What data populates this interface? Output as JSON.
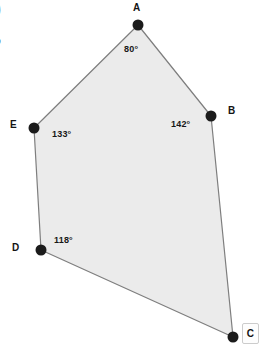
{
  "figure": {
    "type": "polygon-angle-diagram",
    "shape_name": "pentagon ABCDE",
    "canvas": {
      "width": 264,
      "height": 349
    },
    "style": {
      "background": "#ffffff",
      "fill": "#ebebeb",
      "stroke": "#7e7e7e",
      "stroke_width": 1.2,
      "vertex_dot_color": "#1b1b1b",
      "vertex_dot_radius": 5,
      "label_color": "#141414"
    },
    "vertices": [
      {
        "id": "A",
        "label": "A",
        "x": 138,
        "y": 25,
        "label_x": 133,
        "label_y": 3,
        "angle": "80°",
        "angle_x": 124,
        "angle_y": 45
      },
      {
        "id": "B",
        "label": "B",
        "x": 211,
        "y": 116,
        "label_x": 228,
        "label_y": 106,
        "angle": "142°",
        "angle_x": 171,
        "angle_y": 120
      },
      {
        "id": "C",
        "label": "C",
        "x": 233,
        "y": 337,
        "label_x": 242,
        "label_y": 323,
        "angle": "",
        "angle_x": 0,
        "angle_y": 0
      },
      {
        "id": "D",
        "label": "D",
        "x": 41,
        "y": 250,
        "label_x": 12,
        "label_y": 243,
        "angle": "118°",
        "angle_x": 54,
        "angle_y": 236
      },
      {
        "id": "E",
        "label": "E",
        "x": 34,
        "y": 128,
        "label_x": 10,
        "label_y": 120,
        "angle": "133°",
        "angle_x": 52,
        "angle_y": 130
      }
    ],
    "path": "M 138 25 L 211 116 L 233 337 L 41 250 L 34 128 Z",
    "edges": [
      {
        "from": "A",
        "to": "B"
      },
      {
        "from": "B",
        "to": "C"
      },
      {
        "from": "C",
        "to": "D"
      },
      {
        "from": "D",
        "to": "E"
      },
      {
        "from": "E",
        "to": "A"
      }
    ],
    "crop_fragments": [
      {
        "id": "frag-paren",
        "text": ")"
      },
      {
        "id": "frag-question",
        "text": "?"
      }
    ],
    "labels": {
      "vertex_a": "A",
      "vertex_b": "B",
      "vertex_c": "C",
      "vertex_d": "D",
      "vertex_e": "E",
      "angle_a": "80°",
      "angle_b": "142°",
      "angle_d": "118°",
      "angle_e": "133°"
    }
  }
}
